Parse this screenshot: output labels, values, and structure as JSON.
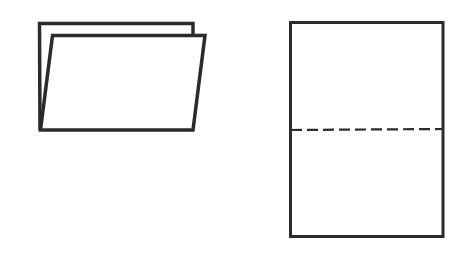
{
  "canvas": {
    "width": 462,
    "height": 254,
    "background": "#ffffff"
  },
  "colors": {
    "stroke": "#2b2b2b",
    "fill": "#ffffff"
  },
  "figures": [
    {
      "id": "folded-sheet",
      "description": "Sheet folded in half, shown in perspective (open folder shape)",
      "back_panel": {
        "points": [
          [
            40,
            130
          ],
          [
            39.5,
            23.5
          ],
          [
            193,
            23.5
          ],
          [
            193,
            35
          ]
        ]
      },
      "front_panel": {
        "points": [
          [
            40.5,
            130
          ],
          [
            52.5,
            35.5
          ],
          [
            205,
            35.5
          ],
          [
            193,
            130
          ]
        ]
      }
    },
    {
      "id": "flat-sheet",
      "description": "Flat unfolded sheet with dashed fold line across the middle",
      "rect": {
        "x": 290.5,
        "y": 22.5,
        "width": 152.5,
        "height": 214
      },
      "fold_line": {
        "x1": 291,
        "y1": 130,
        "x2": 442,
        "y2": 129,
        "dash": "11 5"
      }
    }
  ]
}
